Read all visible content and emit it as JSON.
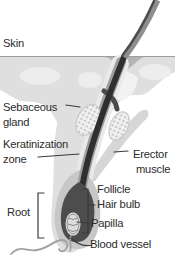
{
  "figure": {
    "labels": {
      "skin": "Skin",
      "sebaceous": {
        "line1": "Sebaceous",
        "line2": "gland"
      },
      "keratinization": {
        "line1": "Keratinization",
        "line2": "zone"
      },
      "erector": {
        "line1": "Erector",
        "line2": "muscle"
      },
      "follicle": "Follicle",
      "hair_bulb": "Hair bulb",
      "root": "Root",
      "papilla": "Papilla",
      "blood_vessel": "Blood vessel"
    },
    "colors": {
      "background": "#ffffff",
      "tissue": "#dfdfdf",
      "tissue_light": "#ededed",
      "infundibulum": "#f2f2f2",
      "muscle": "#d6d6d6",
      "sheath_outer": "#e9e9e9",
      "sheath_mid": "#9e9e9e",
      "bulb_outer": "#c7c7c7",
      "bulb": "#4d4d4d",
      "hair_dark": "#2f2f2f",
      "hair_gray": "#8e8e8e",
      "hair_edge": "#4a4a4a",
      "gland_fill": "#f0f0f0",
      "gland_dot": "#b9b9b9",
      "gland_outline": "#c6c6c6",
      "papilla_fill": "#dcdcdc",
      "papilla_ring": "#e8e8e8",
      "papilla_ridge": "#8a8a8a",
      "vessel": "#a2a2a2",
      "skin_line": "#9e9e9e",
      "dip_shadow": "#b5b5b5",
      "pointer": "#3a3a3a",
      "text": "#2b2b2b"
    }
  }
}
